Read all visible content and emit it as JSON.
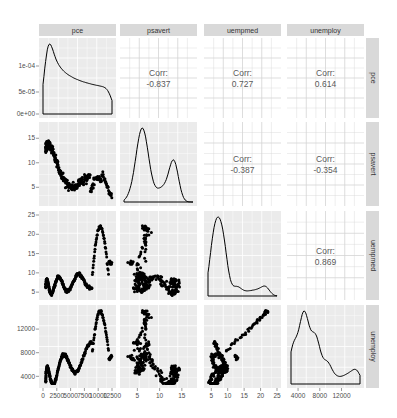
{
  "chart_data": {
    "type": "scatter-matrix",
    "title": "",
    "variables": [
      "pce",
      "psavert",
      "uempmed",
      "unemploy"
    ],
    "strip_labels_top": [
      "pce",
      "psavert",
      "uempmed",
      "unemploy"
    ],
    "strip_labels_right": [
      "pce",
      "psavert",
      "uempmed",
      "unemploy"
    ],
    "correlations": [
      {
        "row": "pce",
        "col": "psavert",
        "label": "Corr:",
        "value": "-0.837"
      },
      {
        "row": "pce",
        "col": "uempmed",
        "label": "Corr:",
        "value": "0.727"
      },
      {
        "row": "pce",
        "col": "unemploy",
        "label": "Corr:",
        "value": "0.614"
      },
      {
        "row": "psavert",
        "col": "uempmed",
        "label": "Corr:",
        "value": "-0.387"
      },
      {
        "row": "psavert",
        "col": "unemploy",
        "label": "Corr:",
        "value": "-0.354"
      },
      {
        "row": "uempmed",
        "col": "unemploy",
        "label": "Corr:",
        "value": "0.869"
      }
    ],
    "y_axis_ticks": {
      "pce_density": [
        "0e+00",
        "5e-05",
        "1e-04"
      ],
      "psavert": [
        "5",
        "10",
        "15"
      ],
      "uempmed": [
        "5",
        "10",
        "15",
        "20",
        "25"
      ],
      "unemploy": [
        "4000",
        "8000",
        "12000"
      ]
    },
    "x_axis_ticks": {
      "pce": [
        "0",
        "2500",
        "5000",
        "7500",
        "10000",
        "12500"
      ],
      "psavert": [
        "5",
        "10",
        "15"
      ],
      "uempmed": [
        "5",
        "10",
        "15",
        "20",
        "25"
      ],
      "unemploy": [
        "4000",
        "8000",
        "12000"
      ]
    },
    "x_axis_tick_render": {
      "pce": "0  2500500075001000012500"
    },
    "ranges": {
      "pce": [
        0,
        12500
      ],
      "psavert": [
        2,
        17.5
      ],
      "uempmed": [
        4,
        25
      ],
      "unemploy": [
        2700,
        15400
      ]
    },
    "density_peaks": {
      "pce": "peak near 500, secondary near 11000",
      "psavert": "bimodal peaks near 6 and 11",
      "uempmed": "peak near 6-7, long right tail",
      "unemploy": "peak near 7800"
    },
    "panel_background": "#ebebeb",
    "strip_background": "#d9d9d9",
    "point_color": "#000000",
    "grid": true,
    "legend": "none"
  }
}
